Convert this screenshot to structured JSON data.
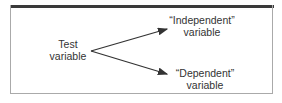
{
  "diagram": {
    "source": {
      "line1": "Test",
      "line2": "variable"
    },
    "targets": [
      {
        "line1": "“Independent”",
        "line2": "variable"
      },
      {
        "line1": "“Dependent”",
        "line2": "variable"
      }
    ],
    "colors": {
      "arrow": "#333333",
      "border": "#aaaaaa",
      "topbar": "#3a3a3a"
    }
  }
}
